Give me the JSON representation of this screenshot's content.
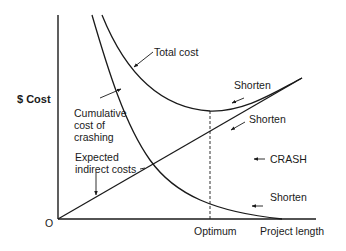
{
  "diagram": {
    "y_axis_label": "$ Cost",
    "x_axis_label": "Project length",
    "origin_label": "O",
    "optimum_label": "Optimum",
    "curves": {
      "total_cost": "Total cost",
      "crash_cost_line1": "Cumulative",
      "crash_cost_line2": "cost of",
      "crash_cost_line3": "crashing",
      "indirect_line1": "Expected",
      "indirect_line2": "indirect costs"
    },
    "annotations": {
      "shorten_total": "Shorten",
      "shorten_indirect": "Shorten",
      "crash": "CRASH",
      "shorten_crash": "Shorten"
    },
    "colors": {
      "line": "#1a1a1a",
      "background": "#ffffff"
    }
  }
}
